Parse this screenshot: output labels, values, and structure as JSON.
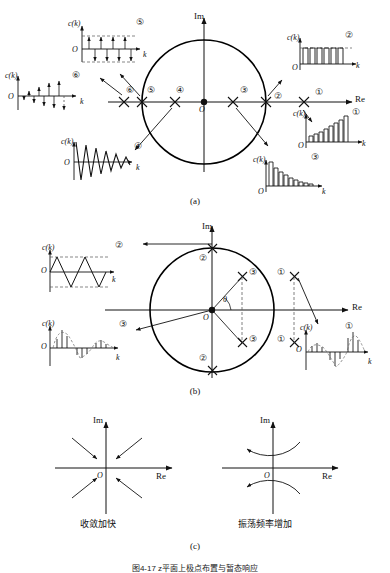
{
  "figure": {
    "caption_a": "(a)",
    "caption_b": "(b)",
    "caption_c": "(c)",
    "bottom_caption": "图4-17   z平面上极点布置与暂态响应"
  },
  "axes": {
    "re_label": "Re",
    "im_label": "Im",
    "origin_label": "O",
    "k_label": "k",
    "ck_label": "c(k)",
    "theta_label": "θ"
  },
  "panel_a": {
    "name": "real-axis pole locations and responses",
    "pole_markers": [
      {
        "id": "1",
        "label": "①",
        "re": 1.45,
        "note": "outside unit circle, positive real"
      },
      {
        "id": "2",
        "label": "②",
        "re": 1.0,
        "note": "on unit circle, positive real"
      },
      {
        "id": "3",
        "label": "③",
        "re": 0.48,
        "note": "inside unit circle, positive real"
      },
      {
        "id": "4",
        "label": "④",
        "re": -0.48,
        "note": "inside unit circle, negative real"
      },
      {
        "id": "5",
        "label": "⑤",
        "re": -1.0,
        "note": "on unit circle, negative real"
      },
      {
        "id": "6",
        "label": "⑥",
        "re": -1.45,
        "note": "outside unit circle, negative real"
      }
    ],
    "responses": [
      {
        "id": "1",
        "label": "①",
        "type": "bar",
        "title": "c(k)",
        "xlabel": "k",
        "description": "monotonically growing positive samples (divergent)",
        "values": [
          0.18,
          0.22,
          0.28,
          0.35,
          0.44,
          0.55,
          0.69,
          0.86,
          1.0
        ]
      },
      {
        "id": "2",
        "label": "②",
        "type": "bar",
        "title": "c(k)",
        "xlabel": "k",
        "description": "constant amplitude positive samples (sustained)",
        "values": [
          1,
          1,
          1,
          1,
          1,
          1,
          1,
          1
        ]
      },
      {
        "id": "3",
        "label": "③",
        "type": "bar",
        "title": "c(k)",
        "xlabel": "k",
        "description": "monotonically decaying positive samples (convergent)",
        "values": [
          1.0,
          0.72,
          0.52,
          0.37,
          0.27,
          0.19,
          0.14,
          0.1,
          0.07,
          0.05
        ]
      },
      {
        "id": "4",
        "label": "④",
        "type": "line",
        "title": "c(k)",
        "xlabel": "k",
        "description": "alternating sign, decaying oscillation (convergent)",
        "values": [
          1.0,
          -0.82,
          0.68,
          -0.56,
          0.46,
          -0.38,
          0.31,
          -0.25,
          0.21,
          -0.17,
          0.14,
          -0.11,
          0.09
        ]
      },
      {
        "id": "5",
        "label": "⑤",
        "type": "stem",
        "title": "c(k)",
        "xlabel": "k",
        "description": "alternating sign, constant amplitude (sustained oscillation)",
        "values": [
          1,
          -1,
          1,
          -1,
          1,
          -1,
          1,
          -1,
          1,
          -1
        ]
      },
      {
        "id": "6",
        "label": "⑥",
        "type": "stem",
        "title": "c(k)",
        "xlabel": "k",
        "description": "alternating sign, growing amplitude (divergent oscillation)",
        "values": [
          0.2,
          -0.28,
          0.38,
          -0.5,
          0.64,
          -0.8,
          1.0,
          -1.2,
          1.45
        ]
      }
    ]
  },
  "panel_b": {
    "name": "complex conjugate pole locations and responses",
    "pole_markers": [
      {
        "id": "1",
        "label": "①",
        "note": "conjugate pair outside unit circle"
      },
      {
        "id": "2",
        "label": "②",
        "note": "conjugate pair on unit circle at ±Im axis"
      },
      {
        "id": "3",
        "label": "③",
        "note": "conjugate pair inside unit circle"
      }
    ],
    "responses": [
      {
        "id": "1",
        "label": "①",
        "type": "stem",
        "title": "c(k)",
        "xlabel": "k",
        "description": "growing oscillatory envelope (divergent)",
        "values": [
          0.18,
          0.3,
          0.22,
          -0.25,
          -0.52,
          -0.4,
          0.42,
          0.82,
          0.95,
          0.55
        ]
      },
      {
        "id": "2",
        "label": "②",
        "type": "line",
        "title": "c(k)",
        "xlabel": "k",
        "description": "constant amplitude triangular oscillation (sustained)",
        "values": [
          0,
          1,
          0,
          -1,
          0,
          1,
          0,
          -1,
          0,
          1,
          0,
          -1
        ]
      },
      {
        "id": "3",
        "label": "③",
        "type": "stem",
        "title": "c(k)",
        "xlabel": "k",
        "description": "decaying oscillatory envelope (convergent)",
        "values": [
          0.45,
          0.92,
          0.6,
          -0.18,
          -0.4,
          -0.3,
          0.14,
          0.3,
          0.22,
          -0.06,
          -0.12
        ]
      }
    ]
  },
  "panel_c": {
    "name": "pole movement trends",
    "left": {
      "label": "收敛加快",
      "meaning": "convergence becomes faster",
      "arrows": "four arrows pointing inward toward origin"
    },
    "right": {
      "label": "振荡频率增加",
      "meaning": "oscillation frequency increases",
      "arrows": "two curved arrows rotating away from positive real axis"
    }
  },
  "colors": {
    "ink": "#111111",
    "circle": "#000000",
    "dashed": "#555555",
    "background": "#ffffff"
  }
}
